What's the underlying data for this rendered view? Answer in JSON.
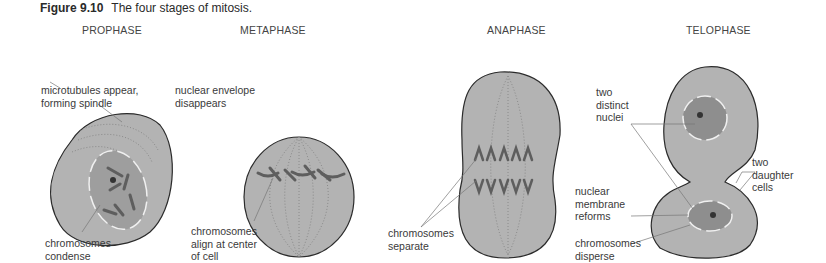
{
  "figure": {
    "number": "Figure 9.10",
    "title": "The four stages of mitosis."
  },
  "stages": [
    {
      "name": "PROPHASE"
    },
    {
      "name": "METAPHASE"
    },
    {
      "name": "ANAPHASE"
    },
    {
      "name": "TELOPHASE"
    }
  ],
  "labels": {
    "prophase": {
      "microtubules": "microtubules appear,\nforming spindle",
      "chromosomes": "chromosomes\ncondense"
    },
    "metaphase": {
      "envelope": "nuclear envelope\ndisappears",
      "chromosomes": "chromosomes\nalign at center\nof cell"
    },
    "anaphase": {
      "chromosomes": "chromosomes\nseparate"
    },
    "telophase": {
      "nuclei": "two\ndistinct\nnuclei",
      "daughters": "two\ndaughter\ncells",
      "membrane": "nuclear\nmembrane\nreforms",
      "disperse": "chromosomes\ndisperse"
    }
  },
  "colors": {
    "cell_fill": "#b3b3b3",
    "cell_outline": "#2b2b2b",
    "chromosome": "#6a6a6a",
    "nucleus": "#8e8e8e",
    "leader_line": "#777777"
  }
}
